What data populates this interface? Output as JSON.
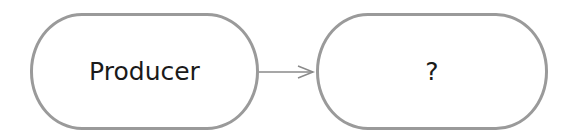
{
  "diagram": {
    "nodes": [
      {
        "id": "producer",
        "label": "Producer"
      },
      {
        "id": "unknown",
        "label": "?"
      }
    ],
    "edges": [
      {
        "from": "producer",
        "to": "unknown",
        "style": "arrow"
      }
    ],
    "colors": {
      "border": "#9a9a9a",
      "text": "#1a1a1a",
      "edge": "#8a8a8a"
    }
  }
}
